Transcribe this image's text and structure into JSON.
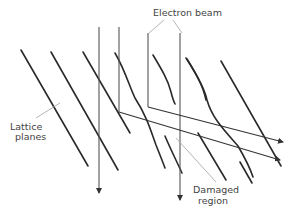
{
  "diagram": {
    "labels": {
      "electron_beam": "Electron beam",
      "lattice_planes_line1": "Lattice",
      "lattice_planes_line2": "planes",
      "damaged_region_line1": "Damaged",
      "damaged_region_line2": "region"
    },
    "colors": {
      "plane": "#2a2a2a",
      "beam": "#555555",
      "leader": "#aaaaaa",
      "text": "#444444"
    }
  }
}
